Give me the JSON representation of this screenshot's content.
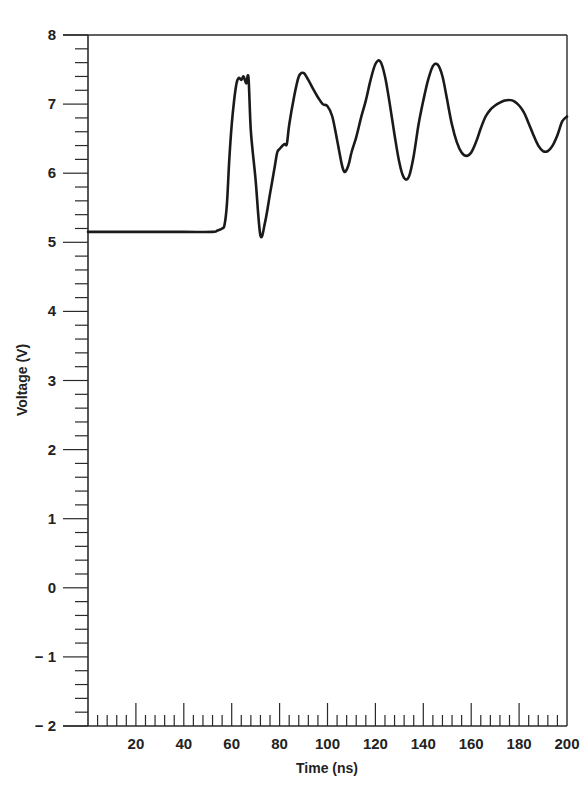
{
  "chart_data": {
    "type": "line",
    "title": "",
    "xlabel": "Time (ns)",
    "ylabel": "Voltage (V)",
    "xlim": [
      0,
      200
    ],
    "ylim": [
      -2,
      8
    ],
    "x_ticks": [
      20,
      40,
      60,
      80,
      100,
      120,
      140,
      160,
      180,
      200
    ],
    "x_tick_labels": [
      "20",
      "40",
      "60",
      "80",
      "100",
      "120",
      "140",
      "160",
      "180",
      "200"
    ],
    "x_minor_step": 4,
    "y_ticks": [
      -2,
      -1,
      0,
      1,
      2,
      3,
      4,
      5,
      6,
      7,
      8
    ],
    "y_tick_labels": [
      "− 2",
      "− 1",
      "0",
      "1",
      "2",
      "3",
      "4",
      "5",
      "6",
      "7",
      "8"
    ],
    "y_minor_step": 0.2,
    "grid": false,
    "legend": null,
    "line_color": "#1a1a1a",
    "series": [
      {
        "name": "Voltage",
        "x": [
          0,
          20,
          40,
          52,
          54,
          56,
          57,
          58,
          59,
          60,
          61,
          62,
          63,
          64,
          65,
          66,
          67,
          68,
          70,
          72,
          74,
          76,
          78,
          79,
          80,
          82,
          83,
          84,
          86,
          88,
          90,
          92,
          94,
          96,
          98,
          100,
          102,
          104,
          106,
          107,
          108,
          109,
          110,
          112,
          114,
          116,
          118,
          120,
          122,
          124,
          126,
          128,
          130,
          132,
          134,
          136,
          138,
          140,
          142,
          144,
          146,
          148,
          150,
          152,
          154,
          156,
          158,
          160,
          162,
          164,
          166,
          168,
          170,
          172,
          174,
          176,
          178,
          180,
          182,
          184,
          186,
          188,
          190,
          192,
          194,
          196,
          198,
          200
        ],
        "y": [
          5.15,
          5.15,
          5.15,
          5.15,
          5.17,
          5.2,
          5.25,
          5.55,
          6.2,
          6.7,
          7.05,
          7.3,
          7.38,
          7.35,
          7.4,
          7.3,
          7.38,
          6.6,
          5.9,
          5.1,
          5.3,
          5.7,
          6.1,
          6.3,
          6.35,
          6.42,
          6.42,
          6.7,
          7.1,
          7.4,
          7.45,
          7.35,
          7.22,
          7.1,
          7.0,
          6.97,
          6.82,
          6.48,
          6.12,
          6.02,
          6.05,
          6.15,
          6.3,
          6.52,
          6.8,
          7.05,
          7.35,
          7.58,
          7.62,
          7.4,
          7.0,
          6.55,
          6.15,
          5.93,
          5.95,
          6.25,
          6.7,
          7.05,
          7.35,
          7.55,
          7.57,
          7.4,
          7.05,
          6.7,
          6.45,
          6.3,
          6.25,
          6.3,
          6.45,
          6.65,
          6.82,
          6.92,
          6.98,
          7.02,
          7.05,
          7.06,
          7.04,
          6.98,
          6.88,
          6.72,
          6.55,
          6.4,
          6.32,
          6.32,
          6.4,
          6.55,
          6.75,
          6.82
        ]
      }
    ]
  }
}
